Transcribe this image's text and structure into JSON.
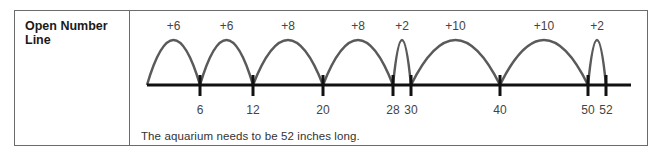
{
  "row_label": "Open Number Line",
  "caption": "The aquarium needs to be 52 inches long.",
  "colors": {
    "arc": "#5a5a5a",
    "axis": "#111111",
    "border": "#6b6b6b"
  },
  "number_line": {
    "start": 0,
    "ticks": [
      6,
      12,
      20,
      28,
      30,
      40,
      50,
      52
    ],
    "jumps": [
      {
        "from": 0,
        "to": 6,
        "label": "+6"
      },
      {
        "from": 6,
        "to": 12,
        "label": "+6"
      },
      {
        "from": 12,
        "to": 20,
        "label": "+8"
      },
      {
        "from": 20,
        "to": 28,
        "label": "+8"
      },
      {
        "from": 28,
        "to": 30,
        "label": "+2"
      },
      {
        "from": 30,
        "to": 40,
        "label": "+10"
      },
      {
        "from": 40,
        "to": 50,
        "label": "+10"
      },
      {
        "from": 50,
        "to": 52,
        "label": "+2"
      }
    ]
  }
}
